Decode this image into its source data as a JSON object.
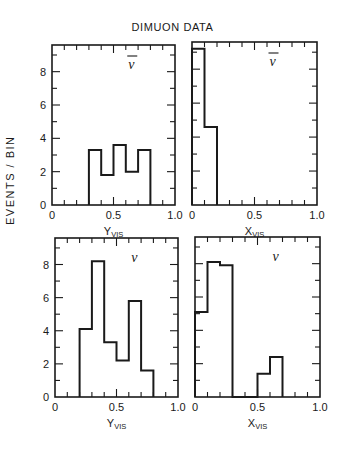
{
  "figure": {
    "title": "DIMUON DATA",
    "ylabel": "EVENTS / BIN"
  },
  "chart_data": [
    {
      "type": "bar",
      "style": "step-histogram",
      "panel": "top-left",
      "label": "ν̄",
      "xlabel": "Y_VIS",
      "ylabel": "EVENTS / BIN",
      "xlim": [
        0,
        1.0
      ],
      "ylim": [
        0,
        9.6
      ],
      "xticks": [
        "0",
        "0.5",
        "1.0"
      ],
      "yticks": [
        "0",
        "2",
        "4",
        "6",
        "8"
      ],
      "bin_edges": [
        0.3,
        0.4,
        0.5,
        0.6,
        0.7,
        0.8
      ],
      "values": [
        3.3,
        1.8,
        3.6,
        2.0,
        3.3
      ]
    },
    {
      "type": "bar",
      "style": "step-histogram",
      "panel": "top-right",
      "label": "ν̄",
      "xlabel": "X_VIS",
      "xlim": [
        0,
        1.0
      ],
      "ylim": [
        0,
        9.6
      ],
      "xticks": [
        "0",
        "0.5",
        "1.0"
      ],
      "bin_edges": [
        0.0,
        0.1,
        0.2
      ],
      "values": [
        9.2,
        4.6
      ]
    },
    {
      "type": "bar",
      "style": "step-histogram",
      "panel": "bottom-left",
      "label": "ν",
      "xlabel": "Y_VIS",
      "ylabel": "EVENTS / BIN",
      "xlim": [
        0,
        1.0
      ],
      "ylim": [
        0,
        9.6
      ],
      "xticks": [
        "0",
        "0.5",
        "1.0"
      ],
      "yticks": [
        "0",
        "2",
        "4",
        "6",
        "8"
      ],
      "bin_edges": [
        0.2,
        0.3,
        0.4,
        0.5,
        0.6,
        0.7,
        0.8
      ],
      "values": [
        4.1,
        8.2,
        3.3,
        2.2,
        5.8,
        1.6
      ]
    },
    {
      "type": "bar",
      "style": "step-histogram",
      "panel": "bottom-right",
      "label": "ν",
      "xlabel": "X_VIS",
      "xlim": [
        0,
        1.0
      ],
      "ylim": [
        0,
        9.6
      ],
      "xticks": [
        "0",
        "0.5",
        "1.0"
      ],
      "bin_edges": [
        0.0,
        0.1,
        0.2,
        0.3,
        0.4,
        0.5,
        0.6,
        0.7
      ],
      "values": [
        5.1,
        8.1,
        7.9,
        0,
        0,
        1.4,
        2.4
      ]
    }
  ]
}
